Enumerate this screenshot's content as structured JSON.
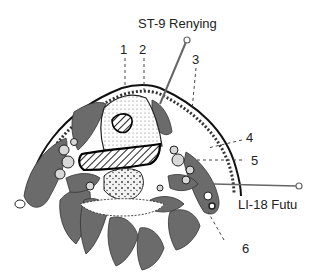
{
  "figure": {
    "colors": {
      "muscle": "#6b6b6b",
      "outline": "#1a1a1a",
      "hatch": "#2a2a2a",
      "needle": "#555555",
      "background": "#ffffff"
    }
  },
  "points": {
    "st9": {
      "label": "ST-9 Renying"
    },
    "li18": {
      "label": "LI-18 Futu"
    }
  },
  "numbers": [
    "1",
    "2",
    "3",
    "4",
    "5",
    "6"
  ]
}
